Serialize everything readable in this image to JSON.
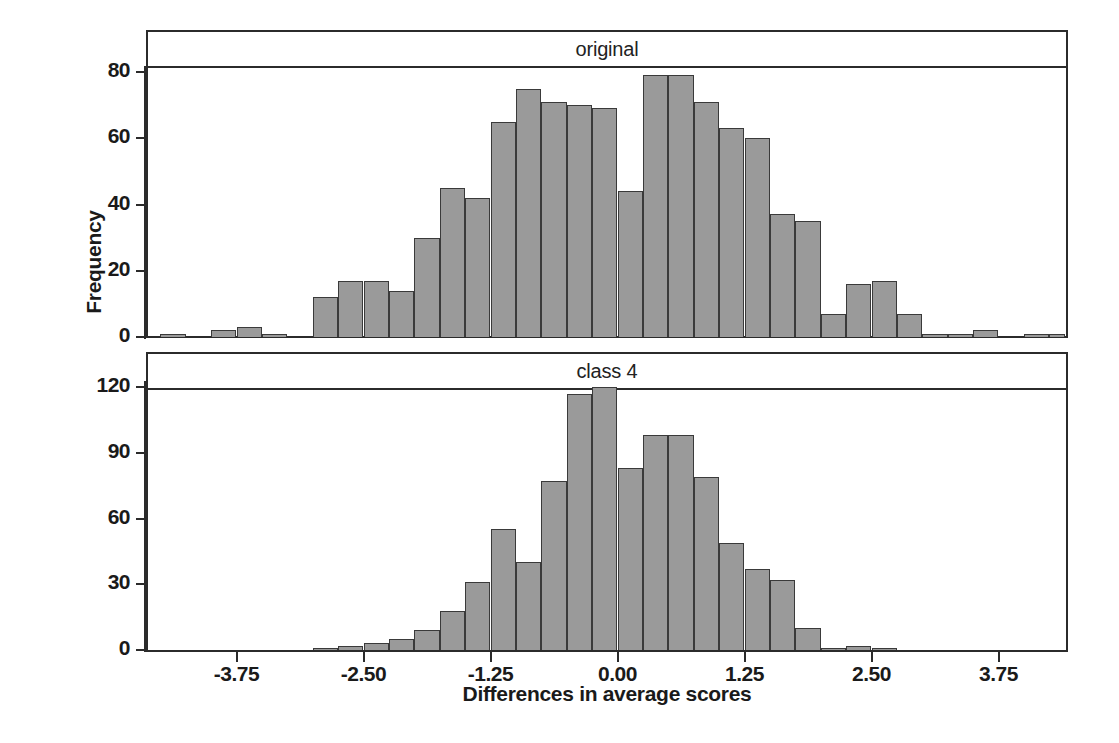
{
  "figure": {
    "ylabel": "Frequency",
    "xlabel": "Differences in average scores"
  },
  "panels": [
    {
      "strip_label": "original"
    },
    {
      "strip_label": "class 4"
    }
  ],
  "axes": {
    "x_ticks": [
      "-3.75",
      "-2.50",
      "-1.25",
      "0.00",
      "1.25",
      "2.50",
      "3.75"
    ],
    "x_tick_values": [
      -3.75,
      -2.5,
      -1.25,
      0,
      1.25,
      2.5,
      3.75
    ],
    "y_ticks_top": [
      "0",
      "20",
      "40",
      "60",
      "80"
    ],
    "y_ticks_bottom": [
      "0",
      "30",
      "60",
      "90",
      "120"
    ]
  },
  "colors": {
    "bar_fill": "#9a9a9a",
    "bar_edge": "#3a3a3a",
    "frame": "#2b2b2b",
    "text": "#1a1a1a",
    "background": "#ffffff"
  },
  "chart_data": [
    {
      "type": "bar",
      "title": "original",
      "xlabel": "Differences in average scores",
      "ylabel": "Frequency",
      "xlim": [
        -4.45,
        4.4
      ],
      "ylim": [
        0,
        88
      ],
      "bin_width": 0.25,
      "grid": false,
      "legend": "none",
      "bin_centers": [
        -4.375,
        -3.875,
        -3.625,
        -3.375,
        -2.875,
        -2.625,
        -2.375,
        -2.125,
        -1.875,
        -1.625,
        -1.375,
        -1.125,
        -0.875,
        -0.625,
        -0.375,
        -0.125,
        0.125,
        0.375,
        0.625,
        0.875,
        1.125,
        1.375,
        1.625,
        1.875,
        2.125,
        2.375,
        2.625,
        2.875,
        3.125,
        3.375,
        3.875,
        4.125,
        4.375
      ],
      "categories": [
        "-4.375",
        "-3.875",
        "-3.625",
        "-3.375",
        "-2.875",
        "-2.625",
        "-2.375",
        "-2.125",
        "-1.875",
        "-1.625",
        "-1.375",
        "-1.125",
        "-0.875",
        "-0.625",
        "-0.375",
        "-0.125",
        "0.125",
        "0.375",
        "0.625",
        "0.875",
        "1.125",
        "1.375",
        "1.625",
        "1.875",
        "2.125",
        "2.375",
        "2.625",
        "2.875",
        "3.125",
        "3.375",
        "3.875",
        "4.125",
        "4.375"
      ],
      "values": [
        1,
        2,
        3,
        1,
        12,
        17,
        17,
        14,
        30,
        45,
        42,
        65,
        75,
        71,
        70,
        69,
        44,
        79,
        79,
        71,
        63,
        60,
        37,
        35,
        7,
        16,
        17,
        7,
        1,
        1,
        2,
        1,
        1
      ],
      "bars": [
        {
          "x0": -4.5,
          "x1": -4.25,
          "value": 1
        },
        {
          "x0": -4.0,
          "x1": -3.75,
          "value": 2
        },
        {
          "x0": -3.75,
          "x1": -3.5,
          "value": 3
        },
        {
          "x0": -3.5,
          "x1": -3.25,
          "value": 1
        },
        {
          "x0": -3.0,
          "x1": -2.75,
          "value": 12
        },
        {
          "x0": -2.75,
          "x1": -2.5,
          "value": 17
        },
        {
          "x0": -2.5,
          "x1": -2.25,
          "value": 17
        },
        {
          "x0": -2.25,
          "x1": -2.0,
          "value": 14
        },
        {
          "x0": -2.0,
          "x1": -1.75,
          "value": 30
        },
        {
          "x0": -1.75,
          "x1": -1.5,
          "value": 45
        },
        {
          "x0": -1.5,
          "x1": -1.25,
          "value": 42
        },
        {
          "x0": -1.25,
          "x1": -1.0,
          "value": 65
        },
        {
          "x0": -1.0,
          "x1": -0.75,
          "value": 75
        },
        {
          "x0": -0.75,
          "x1": -0.5,
          "value": 71
        },
        {
          "x0": -0.5,
          "x1": -0.25,
          "value": 70
        },
        {
          "x0": -0.25,
          "x1": 0.0,
          "value": 69
        },
        {
          "x0": 0.0,
          "x1": 0.25,
          "value": 44
        },
        {
          "x0": 0.25,
          "x1": 0.5,
          "value": 79
        },
        {
          "x0": 0.5,
          "x1": 0.75,
          "value": 79
        },
        {
          "x0": 0.75,
          "x1": 1.0,
          "value": 71
        },
        {
          "x0": 1.0,
          "x1": 1.25,
          "value": 63
        },
        {
          "x0": 1.25,
          "x1": 1.5,
          "value": 60
        },
        {
          "x0": 1.5,
          "x1": 1.75,
          "value": 37
        },
        {
          "x0": 1.75,
          "x1": 2.0,
          "value": 35
        },
        {
          "x0": 2.0,
          "x1": 2.25,
          "value": 7
        },
        {
          "x0": 2.25,
          "x1": 2.5,
          "value": 16
        },
        {
          "x0": 2.5,
          "x1": 2.75,
          "value": 17
        },
        {
          "x0": 2.75,
          "x1": 3.0,
          "value": 7
        },
        {
          "x0": 3.0,
          "x1": 3.25,
          "value": 1
        },
        {
          "x0": 3.25,
          "x1": 3.5,
          "value": 1
        },
        {
          "x0": 3.5,
          "x1": 3.75,
          "value": 2
        },
        {
          "x0": 4.0,
          "x1": 4.25,
          "value": 1
        },
        {
          "x0": 4.25,
          "x1": 4.4,
          "value": 1
        }
      ]
    },
    {
      "type": "bar",
      "title": "class 4",
      "xlabel": "Differences in average scores",
      "ylabel": "Frequency",
      "xlim": [
        -4.45,
        4.4
      ],
      "ylim": [
        0,
        130
      ],
      "bin_width": 0.25,
      "grid": false,
      "legend": "none",
      "bin_centers": [
        -2.875,
        -2.625,
        -2.375,
        -2.125,
        -1.875,
        -1.625,
        -1.375,
        -1.125,
        -0.875,
        -0.625,
        -0.375,
        -0.125,
        0.125,
        0.375,
        0.625,
        0.875,
        1.125,
        1.375,
        1.625,
        1.875,
        2.125,
        2.375,
        2.625
      ],
      "categories": [
        "-2.875",
        "-2.625",
        "-2.375",
        "-2.125",
        "-1.875",
        "-1.625",
        "-1.375",
        "-1.125",
        "-0.875",
        "-0.625",
        "-0.375",
        "-0.125",
        "0.125",
        "0.375",
        "0.625",
        "0.875",
        "1.125",
        "1.375",
        "1.625",
        "1.875",
        "2.125",
        "2.375",
        "2.625"
      ],
      "values": [
        1,
        2,
        3,
        5,
        9,
        18,
        31,
        55,
        40,
        77,
        117,
        120,
        83,
        98,
        98,
        79,
        49,
        37,
        32,
        10,
        1,
        2,
        1
      ],
      "bars": [
        {
          "x0": -3.0,
          "x1": -2.75,
          "value": 1
        },
        {
          "x0": -2.75,
          "x1": -2.5,
          "value": 2
        },
        {
          "x0": -2.5,
          "x1": -2.25,
          "value": 3
        },
        {
          "x0": -2.25,
          "x1": -2.0,
          "value": 5
        },
        {
          "x0": -2.0,
          "x1": -1.75,
          "value": 9
        },
        {
          "x0": -1.75,
          "x1": -1.5,
          "value": 18
        },
        {
          "x0": -1.5,
          "x1": -1.25,
          "value": 31
        },
        {
          "x0": -1.25,
          "x1": -1.0,
          "value": 55
        },
        {
          "x0": -1.0,
          "x1": -0.75,
          "value": 40
        },
        {
          "x0": -0.75,
          "x1": -0.5,
          "value": 77
        },
        {
          "x0": -0.5,
          "x1": -0.25,
          "value": 117
        },
        {
          "x0": -0.25,
          "x1": 0.0,
          "value": 120
        },
        {
          "x0": 0.0,
          "x1": 0.25,
          "value": 83
        },
        {
          "x0": 0.25,
          "x1": 0.5,
          "value": 98
        },
        {
          "x0": 0.5,
          "x1": 0.75,
          "value": 98
        },
        {
          "x0": 0.75,
          "x1": 1.0,
          "value": 79
        },
        {
          "x0": 1.0,
          "x1": 1.25,
          "value": 49
        },
        {
          "x0": 1.25,
          "x1": 1.5,
          "value": 37
        },
        {
          "x0": 1.5,
          "x1": 1.75,
          "value": 32
        },
        {
          "x0": 1.75,
          "x1": 2.0,
          "value": 10
        },
        {
          "x0": 2.0,
          "x1": 2.25,
          "value": 1
        },
        {
          "x0": 2.25,
          "x1": 2.5,
          "value": 2
        },
        {
          "x0": 2.5,
          "x1": 2.75,
          "value": 1
        }
      ]
    }
  ]
}
